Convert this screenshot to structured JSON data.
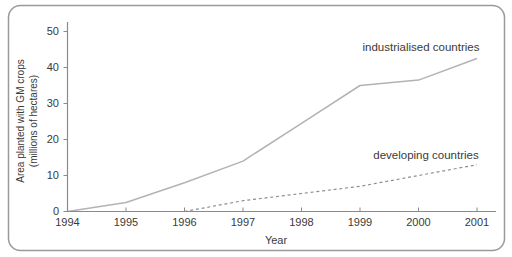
{
  "figure": {
    "border_color": "#9a9a9a",
    "background": "#ffffff"
  },
  "chart_data": {
    "type": "line",
    "title": "",
    "xlabel": "Year",
    "ylabel": "Area planted with GM crops (millions of hectares)",
    "ylabel_lines": [
      "Area planted with GM crops",
      "(millions of hectares)"
    ],
    "x_ticks": [
      "1994",
      "1995",
      "1996",
      "1997",
      "1998",
      "1999",
      "2000",
      "2001"
    ],
    "y_ticks": [
      0,
      10,
      20,
      30,
      40,
      50
    ],
    "xlim": [
      1994,
      2001
    ],
    "ylim": [
      0,
      50
    ],
    "grid": false,
    "legend": "inline-annotations",
    "axis_color": "#8a8a8a",
    "text_color": "#3a3a3a",
    "series": [
      {
        "name": "industrialised countries",
        "line_style": "solid",
        "color": "#b3b3b3",
        "x": [
          1994,
          1995,
          1996,
          1997,
          1998,
          1999,
          2000,
          2001
        ],
        "values": [
          0,
          2.5,
          8,
          14,
          24.5,
          35,
          36.5,
          42.5
        ],
        "label_anchor": {
          "x": 421,
          "y": 51
        }
      },
      {
        "name": "developing countries",
        "line_style": "dashed",
        "color": "#8f8f8f",
        "x": [
          1996,
          1997,
          1998,
          1999,
          2000,
          2001
        ],
        "values": [
          0,
          3,
          5,
          7,
          10,
          13
        ],
        "label_anchor": {
          "x": 426,
          "y": 159
        }
      }
    ]
  }
}
